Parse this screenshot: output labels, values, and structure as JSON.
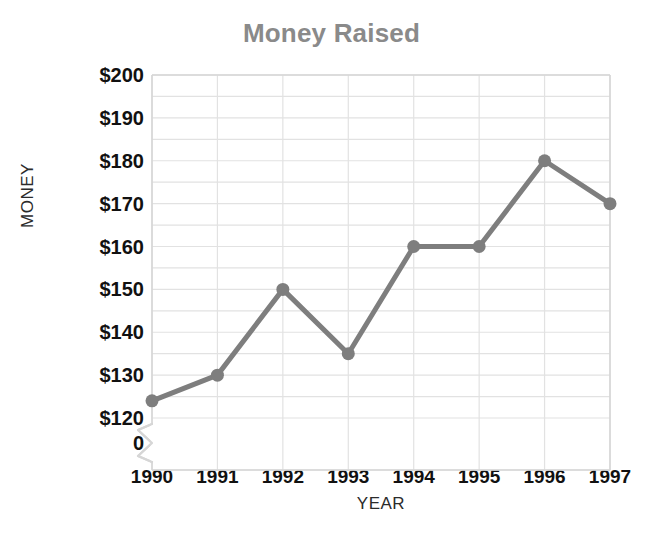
{
  "chart_data": {
    "type": "line",
    "title": "Money Raised",
    "xlabel": "YEAR",
    "ylabel": "MONEY",
    "categories": [
      "1990",
      "1991",
      "1992",
      "1993",
      "1994",
      "1995",
      "1996",
      "1997"
    ],
    "values": [
      124,
      130,
      150,
      135,
      160,
      160,
      180,
      170
    ],
    "series": [
      {
        "name": "Money Raised",
        "values": [
          124,
          130,
          150,
          135,
          160,
          160,
          180,
          170
        ]
      }
    ],
    "ylim": [
      120,
      200
    ],
    "y_tick_labels": [
      "$200",
      "$190",
      "$180",
      "$170",
      "$160",
      "$150",
      "$140",
      "$130",
      "$120",
      "0"
    ],
    "y_tick_values": [
      200,
      190,
      180,
      170,
      160,
      150,
      140,
      130,
      120,
      0
    ],
    "y_major_step": 10,
    "y_minor_step": 5,
    "axis_break": true,
    "axis_break_label": "0",
    "grid": true,
    "legend": "none",
    "colors": {
      "line": "#7e7e7e",
      "marker": "#7e7e7e",
      "grid": "#e2e2e2",
      "frame": "#d6d6d6",
      "title": "#8a8a8a",
      "tick_text": "#111111",
      "axis_label": "#2b2b2b",
      "background": "#ffffff"
    }
  }
}
